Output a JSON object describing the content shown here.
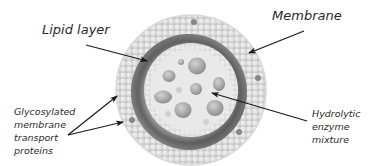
{
  "diagram": {
    "labels": {
      "lipid_layer": "Lipid layer",
      "membrane": "Membrane",
      "glycosylated": [
        "Glycosylated",
        "membrane",
        "transport",
        "proteins"
      ],
      "hydrolytic": [
        "Hydrolytic",
        "enzyme",
        "mixture"
      ]
    },
    "colors": {
      "background": "#ffffff",
      "outer_membrane": "#cfcfcf",
      "membrane_bead": "#e4e4e4",
      "dark_ring": "#6a6a6a",
      "lumen": "#e8e8e8",
      "vesicle": "#a9a9a9",
      "arrow": "#1a1a1a",
      "text": "#2a2a2a"
    }
  }
}
